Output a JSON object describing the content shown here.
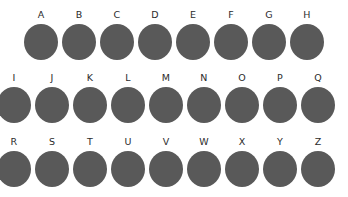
{
  "canvas": {
    "width": 348,
    "height": 197,
    "background_color": "#ffffff"
  },
  "style": {
    "dot_color": "#595959",
    "label_color": "#2b2b2b"
  },
  "grid": {
    "rows": [
      {
        "row_index": 0,
        "row_top": 8,
        "first_center_x": 41,
        "spacing": 38,
        "clipped_left": false,
        "items": [
          {
            "label": "A"
          },
          {
            "label": "B"
          },
          {
            "label": "C"
          },
          {
            "label": "D"
          },
          {
            "label": "E"
          },
          {
            "label": "F"
          },
          {
            "label": "G"
          },
          {
            "label": "H"
          }
        ]
      },
      {
        "row_index": 1,
        "row_top": 71,
        "first_center_x": 14,
        "spacing": 38,
        "clipped_left": true,
        "items": [
          {
            "label": "I"
          },
          {
            "label": "J"
          },
          {
            "label": "K"
          },
          {
            "label": "L"
          },
          {
            "label": "M"
          },
          {
            "label": "N"
          },
          {
            "label": "O"
          },
          {
            "label": "P"
          },
          {
            "label": "Q"
          }
        ]
      },
      {
        "row_index": 2,
        "row_top": 135,
        "first_center_x": 14,
        "spacing": 38,
        "clipped_left": true,
        "items": [
          {
            "label": "R"
          },
          {
            "label": "S"
          },
          {
            "label": "T"
          },
          {
            "label": "U"
          },
          {
            "label": "V"
          },
          {
            "label": "W"
          },
          {
            "label": "X"
          },
          {
            "label": "Y"
          },
          {
            "label": "Z"
          }
        ]
      }
    ]
  }
}
